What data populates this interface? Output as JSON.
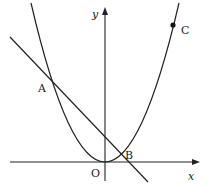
{
  "diagram": {
    "type": "coordinate-graph",
    "axes": {
      "x_label": "x",
      "y_label": "y",
      "origin_label": "O"
    },
    "curves": [
      {
        "kind": "parabola",
        "description": "upward parabola with vertex at origin"
      },
      {
        "kind": "line",
        "description": "line with negative slope intersecting parabola at A and B"
      }
    ],
    "points": [
      {
        "label": "A",
        "description": "left intersection of line and parabola"
      },
      {
        "label": "B",
        "description": "right intersection of line and parabola"
      },
      {
        "label": "C",
        "description": "marked point on parabola (filled dot)"
      }
    ],
    "colors": {
      "stroke": "#222222",
      "background": "#ffffff"
    }
  }
}
